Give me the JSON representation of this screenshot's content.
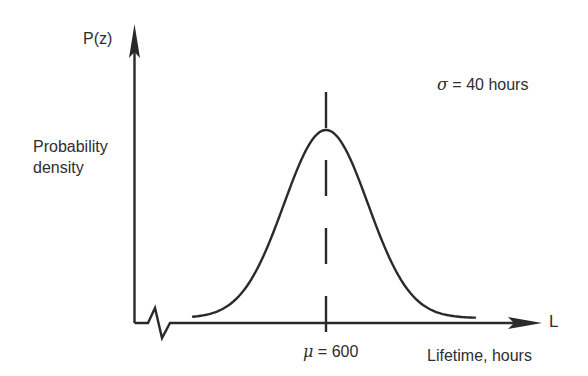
{
  "chart_data": {
    "type": "line",
    "title": "",
    "xlabel": "Lifetime, hours",
    "x_axis_symbol": "L",
    "ylabel": "P(z)",
    "ylabel_description": "Probability density",
    "series": [
      {
        "name": "Normal probability density",
        "distribution": "normal",
        "mean": 600,
        "std_dev": 40
      }
    ],
    "annotations": [
      {
        "text_symbol": "σ",
        "text_rest": " = 40 hours",
        "position": "top-right"
      },
      {
        "text_symbol": "μ",
        "text_rest": " = 600",
        "position": "below x-axis at mean",
        "marker": "dashed vertical line at mean"
      }
    ],
    "axis_break": "zigzag on x-axis near origin",
    "grid": false,
    "legend": null
  },
  "labels": {
    "y_axis": "P(z)",
    "y_desc_line1": "Probability",
    "y_desc_line2": "density",
    "x_axis_symbol": "L",
    "x_axis_title": "Lifetime, hours",
    "sigma_symbol": "σ",
    "sigma_text": " = 40 hours",
    "mu_symbol": "μ",
    "mu_text": " = 600"
  },
  "colors": {
    "ink": "#2a2a2a",
    "background": "#ffffff"
  }
}
